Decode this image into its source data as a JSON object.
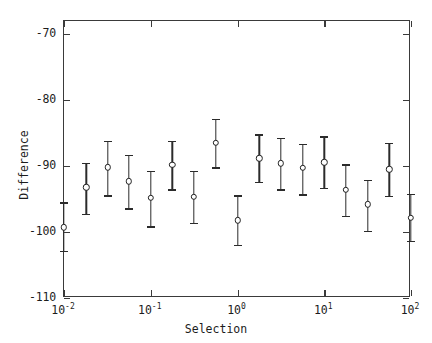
{
  "chart_data": {
    "type": "scatter",
    "title": "",
    "xlabel": "Selection",
    "ylabel": "Difference",
    "xscale": "log",
    "yscale": "linear",
    "xlim": [
      0.01,
      100
    ],
    "ylim": [
      -110,
      -68
    ],
    "grid": false,
    "legend": null,
    "xticks": [
      {
        "value": 0.01,
        "label_base": "10",
        "label_exp": "-2"
      },
      {
        "value": 0.1,
        "label_base": "10",
        "label_exp": "-1"
      },
      {
        "value": 1,
        "label_base": "10",
        "label_exp": "0"
      },
      {
        "value": 10,
        "label_base": "10",
        "label_exp": "1"
      },
      {
        "value": 100,
        "label_base": "10",
        "label_exp": "2"
      }
    ],
    "yticks": [
      {
        "value": -70,
        "label": "-70"
      },
      {
        "value": -80,
        "label": "-80"
      },
      {
        "value": -90,
        "label": "-90"
      },
      {
        "value": -100,
        "label": "-100"
      },
      {
        "value": -110,
        "label": "-110"
      }
    ],
    "marker_style": "open-circle",
    "series": [
      {
        "name": "Difference vs Selection",
        "points": [
          {
            "x": 0.01,
            "y": -99.3,
            "yerr_low": -102.8,
            "yerr_high": -95.5
          },
          {
            "x": 0.018,
            "y": -93.2,
            "yerr_low": -97.2,
            "yerr_high": -89.5
          },
          {
            "x": 0.032,
            "y": -90.2,
            "yerr_low": -94.4,
            "yerr_high": -86.2
          },
          {
            "x": 0.056,
            "y": -92.3,
            "yerr_low": -96.4,
            "yerr_high": -88.3
          },
          {
            "x": 0.1,
            "y": -94.8,
            "yerr_low": -99.1,
            "yerr_high": -90.7
          },
          {
            "x": 0.178,
            "y": -89.8,
            "yerr_low": -93.5,
            "yerr_high": -86.2
          },
          {
            "x": 0.316,
            "y": -94.7,
            "yerr_low": -98.6,
            "yerr_high": -90.7
          },
          {
            "x": 0.562,
            "y": -86.5,
            "yerr_low": -90.2,
            "yerr_high": -82.8
          },
          {
            "x": 1.0,
            "y": -98.2,
            "yerr_low": -101.9,
            "yerr_high": -94.4
          },
          {
            "x": 1.778,
            "y": -88.8,
            "yerr_low": -92.4,
            "yerr_high": -85.2
          },
          {
            "x": 3.162,
            "y": -89.6,
            "yerr_low": -93.5,
            "yerr_high": -85.7
          },
          {
            "x": 5.623,
            "y": -90.3,
            "yerr_low": -94.3,
            "yerr_high": -86.6
          },
          {
            "x": 10.0,
            "y": -89.4,
            "yerr_low": -93.3,
            "yerr_high": -85.5
          },
          {
            "x": 17.783,
            "y": -93.6,
            "yerr_low": -97.5,
            "yerr_high": -89.7
          },
          {
            "x": 31.623,
            "y": -95.8,
            "yerr_low": -99.8,
            "yerr_high": -92.1
          },
          {
            "x": 56.234,
            "y": -90.5,
            "yerr_low": -94.5,
            "yerr_high": -86.5
          },
          {
            "x": 100.0,
            "y": -97.8,
            "yerr_low": -101.3,
            "yerr_high": -94.2
          }
        ]
      }
    ]
  }
}
